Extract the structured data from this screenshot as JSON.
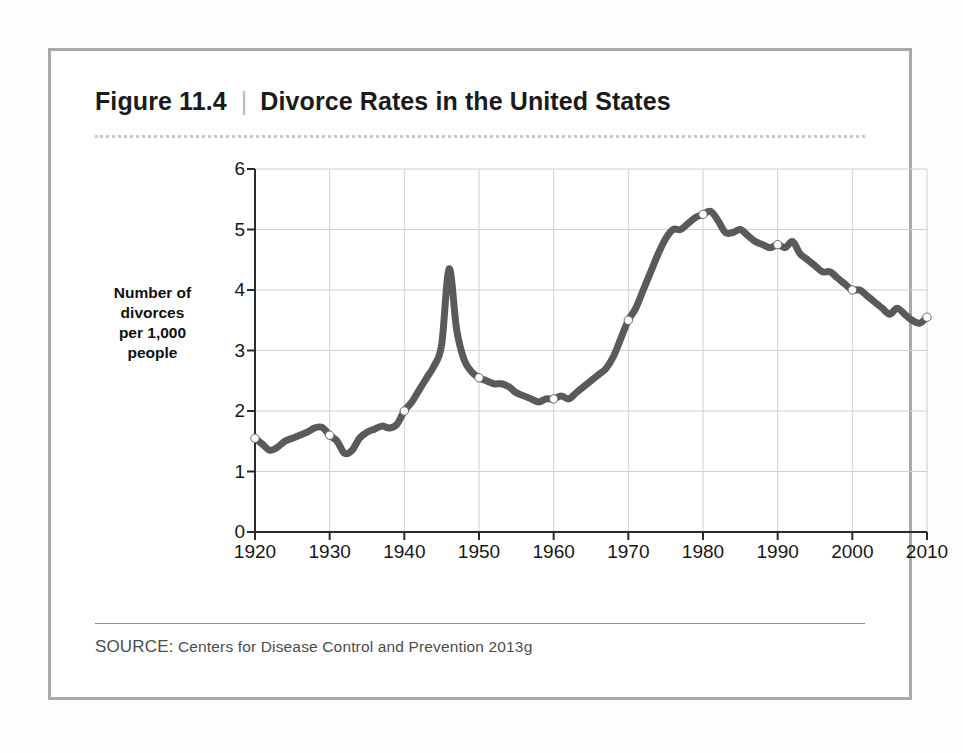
{
  "figure": {
    "number": "Figure 11.4",
    "divider": "|",
    "title": "Divorce Rates in the United States",
    "source_label": "SOURCE:",
    "source_text": "Centers for Disease Control and Prevention 2013g",
    "frame_color": "#a9a9a9",
    "background_color": "#ffffff"
  },
  "chart_data": {
    "type": "line",
    "title": "Divorce Rates in the United States",
    "xlabel": "",
    "ylabel": "Number of divorces per 1,000 people",
    "ylabel_lines": [
      "Number of",
      "divorces",
      "per 1,000",
      "people"
    ],
    "xlim": [
      1920,
      2010
    ],
    "ylim": [
      0,
      6
    ],
    "ytick_labels": [
      "0",
      "1",
      "2",
      "3",
      "4",
      "5",
      "6"
    ],
    "yticks": [
      0,
      1,
      2,
      3,
      4,
      5,
      6
    ],
    "xtick_labels": [
      "1920",
      "1930",
      "1940",
      "1950",
      "1960",
      "1970",
      "1980",
      "1990",
      "2000",
      "2010"
    ],
    "xticks": [
      1920,
      1930,
      1940,
      1950,
      1960,
      1970,
      1980,
      1990,
      2000,
      2010
    ],
    "grid": true,
    "grid_color": "#cfcfcf",
    "legend": null,
    "line_color": "#5a5a5a",
    "line_width": 7,
    "marker": "open-circle",
    "marker_face_color": "#ffffff",
    "marker_years": [
      1920,
      1930,
      1940,
      1950,
      1960,
      1970,
      1980,
      1990,
      2000,
      2010
    ],
    "marker_values": [
      1.55,
      1.6,
      2.0,
      2.55,
      2.2,
      3.5,
      5.25,
      4.75,
      4.0,
      3.55
    ],
    "x": [
      1920,
      1921,
      1922,
      1923,
      1924,
      1925,
      1926,
      1927,
      1928,
      1929,
      1930,
      1931,
      1932,
      1933,
      1934,
      1935,
      1936,
      1937,
      1938,
      1939,
      1940,
      1941,
      1942,
      1943,
      1944,
      1945,
      1946,
      1947,
      1948,
      1949,
      1950,
      1951,
      1952,
      1953,
      1954,
      1955,
      1956,
      1957,
      1958,
      1959,
      1960,
      1961,
      1962,
      1963,
      1964,
      1965,
      1966,
      1967,
      1968,
      1969,
      1970,
      1971,
      1972,
      1973,
      1974,
      1975,
      1976,
      1977,
      1978,
      1979,
      1980,
      1981,
      1982,
      1983,
      1984,
      1985,
      1986,
      1987,
      1988,
      1989,
      1990,
      1991,
      1992,
      1993,
      1994,
      1995,
      1996,
      1997,
      1998,
      1999,
      2000,
      2001,
      2002,
      2003,
      2004,
      2005,
      2006,
      2007,
      2008,
      2009,
      2010
    ],
    "values": [
      1.55,
      1.45,
      1.35,
      1.4,
      1.5,
      1.55,
      1.6,
      1.65,
      1.72,
      1.73,
      1.6,
      1.5,
      1.3,
      1.35,
      1.55,
      1.65,
      1.7,
      1.75,
      1.72,
      1.78,
      2.0,
      2.15,
      2.35,
      2.55,
      2.75,
      3.1,
      4.35,
      3.35,
      2.85,
      2.65,
      2.55,
      2.5,
      2.45,
      2.45,
      2.4,
      2.3,
      2.25,
      2.2,
      2.15,
      2.2,
      2.2,
      2.25,
      2.2,
      2.3,
      2.4,
      2.5,
      2.6,
      2.7,
      2.9,
      3.2,
      3.5,
      3.7,
      4.0,
      4.3,
      4.6,
      4.85,
      5.0,
      5.0,
      5.1,
      5.2,
      5.25,
      5.3,
      5.15,
      4.95,
      4.95,
      5.0,
      4.9,
      4.8,
      4.75,
      4.7,
      4.75,
      4.7,
      4.8,
      4.6,
      4.5,
      4.4,
      4.3,
      4.3,
      4.2,
      4.1,
      4.0,
      4.0,
      3.9,
      3.8,
      3.7,
      3.6,
      3.7,
      3.6,
      3.5,
      3.45,
      3.55
    ]
  }
}
